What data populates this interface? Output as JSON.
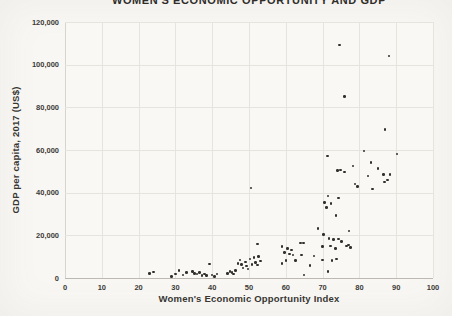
{
  "chart": {
    "title": "WOMEN'S ECONOMIC OPPORTUNITY AND GDP",
    "x_axis_title": "Women's Economic Opportunity Index",
    "y_axis_title": "GDP per capita, 2017 (US$)"
  },
  "colors": {
    "background": "#f8f7f4",
    "gridline": "#e6e4df",
    "point": "#32302c",
    "text": "#2f2d2a"
  },
  "chart_data": {
    "type": "scatter",
    "title": "WOMEN'S ECONOMIC OPPORTUNITY AND GDP",
    "xlabel": "Women's Economic Opportunity Index",
    "ylabel": "GDP per capita, 2017 (US$)",
    "xlim": [
      0,
      100
    ],
    "ylim": [
      0,
      120000
    ],
    "grid": true,
    "x_ticks": [
      0,
      10,
      20,
      30,
      40,
      50,
      60,
      70,
      80,
      90,
      100
    ],
    "y_ticks": [
      {
        "value": 0,
        "label": "0"
      },
      {
        "value": 20000,
        "label": "20,000"
      },
      {
        "value": 40000,
        "label": "40,000"
      },
      {
        "value": 60000,
        "label": "60,000"
      },
      {
        "value": 80000,
        "label": "80,000"
      },
      {
        "value": 100000,
        "label": "100,000"
      },
      {
        "value": 120000,
        "label": "120,000"
      }
    ],
    "points": [
      [
        23,
        2200
      ],
      [
        24,
        2700
      ],
      [
        29,
        800
      ],
      [
        30,
        1900
      ],
      [
        31,
        3400
      ],
      [
        32,
        1300
      ],
      [
        33,
        2600
      ],
      [
        34.6,
        3100
      ],
      [
        35.2,
        2200
      ],
      [
        35.9,
        1900
      ],
      [
        36.5,
        2500
      ],
      [
        37.2,
        1100
      ],
      [
        37.9,
        1900
      ],
      [
        38.5,
        1100
      ],
      [
        39.3,
        6500
      ],
      [
        39.9,
        1400
      ],
      [
        40.6,
        800
      ],
      [
        41.3,
        1900
      ],
      [
        44.2,
        2200
      ],
      [
        44.8,
        3000
      ],
      [
        45.4,
        2500
      ],
      [
        45.8,
        1900
      ],
      [
        46.3,
        3400
      ],
      [
        47,
        6900
      ],
      [
        47.5,
        8400
      ],
      [
        47.9,
        6400
      ],
      [
        48.4,
        4800
      ],
      [
        49,
        7600
      ],
      [
        49.3,
        5600
      ],
      [
        49.7,
        4200
      ],
      [
        50.3,
        8900
      ],
      [
        50.8,
        6400
      ],
      [
        51.3,
        9500
      ],
      [
        51.7,
        7300
      ],
      [
        52.3,
        6100
      ],
      [
        52.6,
        10000
      ],
      [
        53.1,
        8000
      ],
      [
        52.3,
        15900
      ],
      [
        50.5,
        42300
      ],
      [
        58.9,
        6900
      ],
      [
        59,
        14700
      ],
      [
        59.6,
        12000
      ],
      [
        60.1,
        8100
      ],
      [
        60.4,
        13900
      ],
      [
        61,
        11300
      ],
      [
        61.6,
        13100
      ],
      [
        62,
        10800
      ],
      [
        62.7,
        8100
      ],
      [
        64,
        16500
      ],
      [
        64.3,
        10800
      ],
      [
        64.8,
        16300
      ],
      [
        65,
        1400
      ],
      [
        66.6,
        5800
      ],
      [
        67.7,
        10300
      ],
      [
        68.7,
        23300
      ],
      [
        70,
        14700
      ],
      [
        70,
        8400
      ],
      [
        70.2,
        20500
      ],
      [
        71.4,
        3000
      ],
      [
        71.7,
        18600
      ],
      [
        72.1,
        15100
      ],
      [
        72.5,
        8100
      ],
      [
        72.9,
        18100
      ],
      [
        73.5,
        13900
      ],
      [
        73.8,
        8800
      ],
      [
        74.3,
        18300
      ],
      [
        75.1,
        17000
      ],
      [
        76.5,
        15000
      ],
      [
        77,
        15500
      ],
      [
        77.6,
        14400
      ],
      [
        70.5,
        35300
      ],
      [
        71.1,
        33100
      ],
      [
        71.4,
        38400
      ],
      [
        72.3,
        35000
      ],
      [
        73.7,
        29300
      ],
      [
        74.3,
        37600
      ],
      [
        77.2,
        22000
      ],
      [
        74.1,
        50300
      ],
      [
        74.8,
        50600
      ],
      [
        76,
        49800
      ],
      [
        78.3,
        52600
      ],
      [
        78.8,
        44100
      ],
      [
        79.5,
        42800
      ],
      [
        82.3,
        47800
      ],
      [
        83.2,
        54200
      ],
      [
        83.5,
        41700
      ],
      [
        85.1,
        51400
      ],
      [
        86.5,
        48600
      ],
      [
        86.8,
        45100
      ],
      [
        87.7,
        45900
      ],
      [
        88.3,
        48600
      ],
      [
        71.3,
        57200
      ],
      [
        74.6,
        109200
      ],
      [
        75.9,
        85000
      ],
      [
        81.3,
        59500
      ],
      [
        87,
        69700
      ],
      [
        88,
        104100
      ],
      [
        90.2,
        58200
      ]
    ]
  }
}
